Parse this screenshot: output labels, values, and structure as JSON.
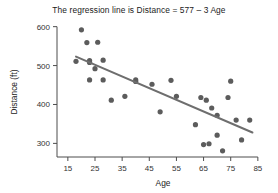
{
  "chart_data": {
    "type": "scatter",
    "title": "The regression line is Distance = 577 – 3 Age",
    "xlabel": "Age",
    "ylabel": "Distance (ft)",
    "xlim": [
      11,
      88
    ],
    "ylim": [
      265,
      612
    ],
    "xticks": [
      15,
      25,
      35,
      45,
      55,
      65,
      75,
      85
    ],
    "yticks": [
      300,
      400,
      500,
      600
    ],
    "grid": false,
    "legend": null,
    "point_color": "#5c5c5c",
    "line_color": "#6e6e6e",
    "regression": {
      "equation": "Distance = 577 – 3 Age",
      "intercept": 577,
      "slope": -3,
      "x_start": 18,
      "y_start": 523,
      "x_end": 83,
      "y_end": 328
    },
    "points": [
      {
        "x": 18,
        "y": 511
      },
      {
        "x": 20,
        "y": 592
      },
      {
        "x": 22,
        "y": 559
      },
      {
        "x": 23,
        "y": 513
      },
      {
        "x": 23,
        "y": 508
      },
      {
        "x": 23,
        "y": 463
      },
      {
        "x": 25,
        "y": 492
      },
      {
        "x": 26,
        "y": 560
      },
      {
        "x": 28,
        "y": 514
      },
      {
        "x": 28,
        "y": 463
      },
      {
        "x": 31,
        "y": 411
      },
      {
        "x": 36,
        "y": 421
      },
      {
        "x": 40,
        "y": 463
      },
      {
        "x": 40,
        "y": 459
      },
      {
        "x": 46,
        "y": 452
      },
      {
        "x": 49,
        "y": 381
      },
      {
        "x": 53,
        "y": 462
      },
      {
        "x": 55,
        "y": 421
      },
      {
        "x": 62,
        "y": 348
      },
      {
        "x": 64,
        "y": 418
      },
      {
        "x": 65,
        "y": 297
      },
      {
        "x": 66,
        "y": 411
      },
      {
        "x": 67,
        "y": 299
      },
      {
        "x": 68,
        "y": 391
      },
      {
        "x": 70,
        "y": 321
      },
      {
        "x": 70,
        "y": 372
      },
      {
        "x": 72,
        "y": 281
      },
      {
        "x": 74,
        "y": 418
      },
      {
        "x": 75,
        "y": 460
      },
      {
        "x": 77,
        "y": 360
      },
      {
        "x": 79,
        "y": 309
      },
      {
        "x": 82,
        "y": 360
      }
    ]
  }
}
